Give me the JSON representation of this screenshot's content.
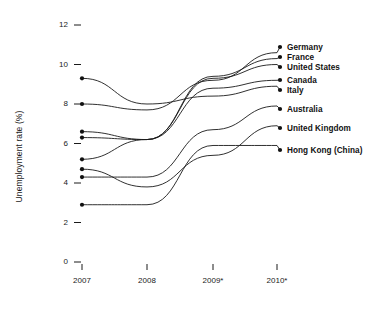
{
  "chart_data": {
    "type": "line",
    "title": "",
    "subtitle": "",
    "xlabel": "",
    "ylabel": "Unemployment rate (%)",
    "categories": [
      "2007",
      "2008",
      "2009*",
      "2010*"
    ],
    "x_tick_labels": [
      "2007",
      "2008",
      "2009*",
      "2010*"
    ],
    "y_tick_labels": [
      "0",
      "2",
      "4",
      "6",
      "8",
      "10",
      "12"
    ],
    "y_ticks": [
      0,
      2,
      4,
      6,
      8,
      10,
      12
    ],
    "ylim": [
      0,
      12
    ],
    "grid": false,
    "legend_position": "right-inline-labels",
    "marker": "filled-circle",
    "line_color": "#1a1a1a",
    "marker_color": "#111111",
    "footnote": "* denotes projected values",
    "series": [
      {
        "name": "Germany",
        "values": [
          8.0,
          7.7,
          9.2,
          10.6
        ]
      },
      {
        "name": "France",
        "values": [
          6.3,
          6.2,
          9.4,
          10.3
        ]
      },
      {
        "name": "United States",
        "values": [
          5.2,
          6.2,
          9.3,
          10.0
        ]
      },
      {
        "name": "Canada",
        "values": [
          6.6,
          6.2,
          8.8,
          9.2
        ]
      },
      {
        "name": "Italy",
        "values": [
          9.3,
          8.0,
          8.4,
          8.9
        ]
      },
      {
        "name": "Australia",
        "values": [
          4.3,
          4.3,
          6.7,
          7.9
        ]
      },
      {
        "name": "United Kingdom",
        "values": [
          4.7,
          3.8,
          5.4,
          6.9
        ]
      },
      {
        "name": "Hong Kong (China)",
        "values": [
          2.9,
          2.9,
          5.9,
          5.9
        ]
      }
    ]
  },
  "labels": {
    "germany": "Germany",
    "france": "France",
    "united_states": "United States",
    "canada": "Canada",
    "italy": "Italy",
    "australia": "Australia",
    "united_kingdom": "United Kingdom",
    "hong_kong": "Hong Kong (China)"
  },
  "axis": {
    "y_title": "Unemployment rate (%)",
    "y0": "0",
    "y2": "2",
    "y4": "4",
    "y6": "6",
    "y8": "8",
    "y10": "10",
    "y12": "12",
    "x1": "2007",
    "x2": "2008",
    "x3": "2009*",
    "x4": "2010*"
  }
}
